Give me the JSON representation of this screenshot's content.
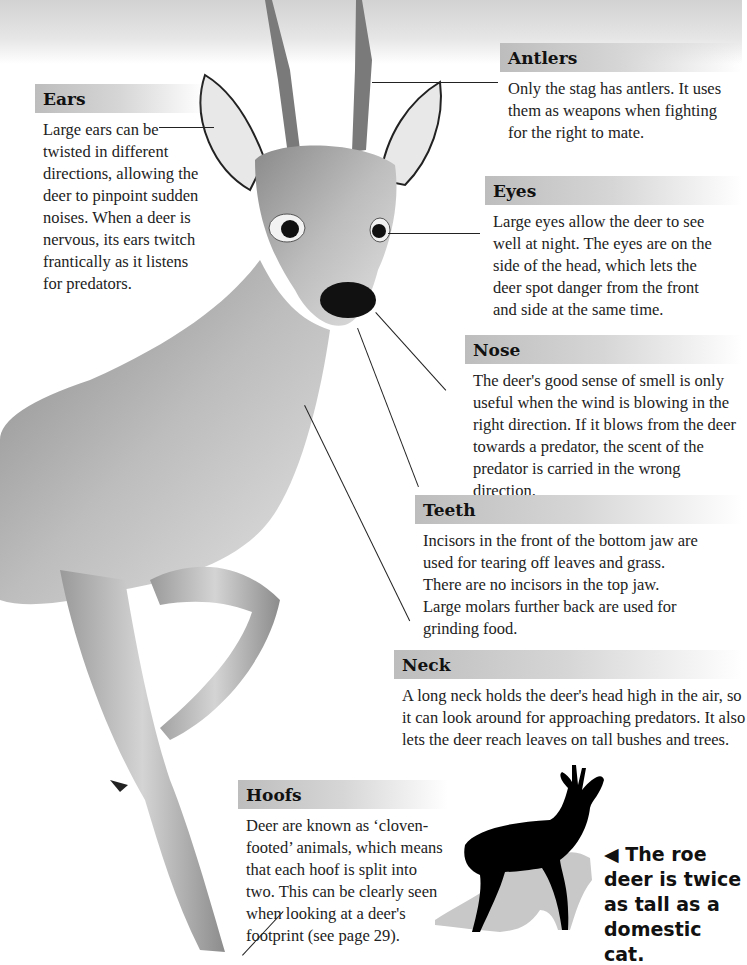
{
  "page": {
    "topic": "Roe deer anatomy"
  },
  "labels": {
    "antlers": {
      "title": "Antlers",
      "text": "Only the stag has antlers. It uses them as weapons when fighting for the right to mate."
    },
    "ears": {
      "title": "Ears",
      "text": "Large ears can be twisted in different directions, allowing the deer to pinpoint sudden noises. When a deer is nervous, its ears twitch frantically as it listens for predators."
    },
    "eyes": {
      "title": "Eyes",
      "text": "Large eyes allow the deer to see well at night. The eyes are on the side of the head, which lets the deer spot danger from the front and side at the same time."
    },
    "nose": {
      "title": "Nose",
      "text": "The deer's good sense of smell is only useful when the wind is blowing in the right direction. If it blows from the deer towards a predator, the scent of the predator is carried in the wrong direction."
    },
    "teeth": {
      "title": "Teeth",
      "text": "Incisors in the front of the bottom jaw are used for tearing off leaves and grass. There are no incisors in the top jaw. Large molars further back are used for grinding food."
    },
    "neck": {
      "title": "Neck",
      "text": "A long neck holds the deer's head high in the air, so it can look around for approaching predators. It also lets the deer reach leaves on tall bushes and trees."
    },
    "hoofs": {
      "title": "Hoofs",
      "text": "Deer are known as ‘cloven-footed’ animals, which means that each hoof is split into two. This can be clearly seen when looking at a deer's footprint (see page 29)."
    }
  },
  "caption": {
    "arrow": "◀",
    "text": "The roe deer is twice as tall as a domestic cat."
  },
  "colors": {
    "header_bar": "#bdbdbd",
    "silhouette": "#000000",
    "cat_shadow": "#c8c8c8"
  }
}
